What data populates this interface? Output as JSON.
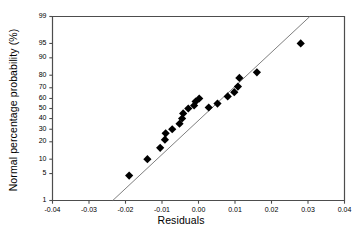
{
  "chart_data": {
    "type": "scatter",
    "title": "",
    "subtitle": "",
    "xlabel": "Residuals",
    "ylabel": "Normal percentage probability (%)",
    "xlim": [
      -0.04,
      0.04
    ],
    "ylim": [
      1,
      99
    ],
    "grid": false,
    "legend": "none",
    "y_scale": "normal-probability",
    "x_ticks": [
      -0.04,
      -0.03,
      -0.02,
      -0.01,
      0.0,
      0.01,
      0.02,
      0.03,
      0.04
    ],
    "x_tick_labels": [
      "-0.04",
      "-0.03",
      "-0.02",
      "-0.01",
      "0.00",
      "0.01",
      "0.02",
      "0.03",
      "0.04"
    ],
    "y_ticks": [
      1,
      5,
      10,
      20,
      30,
      40,
      50,
      60,
      70,
      80,
      90,
      95,
      99
    ],
    "y_tick_labels": [
      "1",
      "5",
      "10",
      "20",
      "30",
      "40",
      "50",
      "60",
      "70",
      "80",
      "90",
      "95",
      "99"
    ],
    "series": [
      {
        "name": "residual points",
        "marker": "diamond",
        "marker_color": "#000000",
        "marker_size": 7,
        "points": [
          {
            "x": -0.019,
            "y": 4.5
          },
          {
            "x": -0.014,
            "y": 10.0
          },
          {
            "x": -0.0105,
            "y": 16.0
          },
          {
            "x": -0.0092,
            "y": 21.5
          },
          {
            "x": -0.009,
            "y": 26.5
          },
          {
            "x": -0.0072,
            "y": 30.0
          },
          {
            "x": -0.0052,
            "y": 35.0
          },
          {
            "x": -0.0045,
            "y": 40.0
          },
          {
            "x": -0.0042,
            "y": 45.0
          },
          {
            "x": -0.0028,
            "y": 50.0
          },
          {
            "x": -0.0012,
            "y": 53.0
          },
          {
            "x": -0.0008,
            "y": 57.0
          },
          {
            "x": 0.0002,
            "y": 60.0
          },
          {
            "x": 0.0028,
            "y": 51.0
          },
          {
            "x": 0.0052,
            "y": 55.0
          },
          {
            "x": 0.008,
            "y": 62.0
          },
          {
            "x": 0.0098,
            "y": 66.0
          },
          {
            "x": 0.0108,
            "y": 71.0
          },
          {
            "x": 0.0112,
            "y": 78.0
          },
          {
            "x": 0.016,
            "y": 82.0
          },
          {
            "x": 0.028,
            "y": 95.0
          }
        ]
      }
    ],
    "reference_line": {
      "name": "normal reference line",
      "color": "#7f7f7f",
      "width": 1,
      "start": {
        "x": -0.0235,
        "y": 1.0
      },
      "end": {
        "x": 0.0305,
        "y": 99.0
      }
    },
    "colors": {
      "marker": "#000000",
      "line": "#7f7f7f",
      "axis": "#4d4d4d",
      "text": "#000000",
      "background": "#ffffff"
    }
  }
}
